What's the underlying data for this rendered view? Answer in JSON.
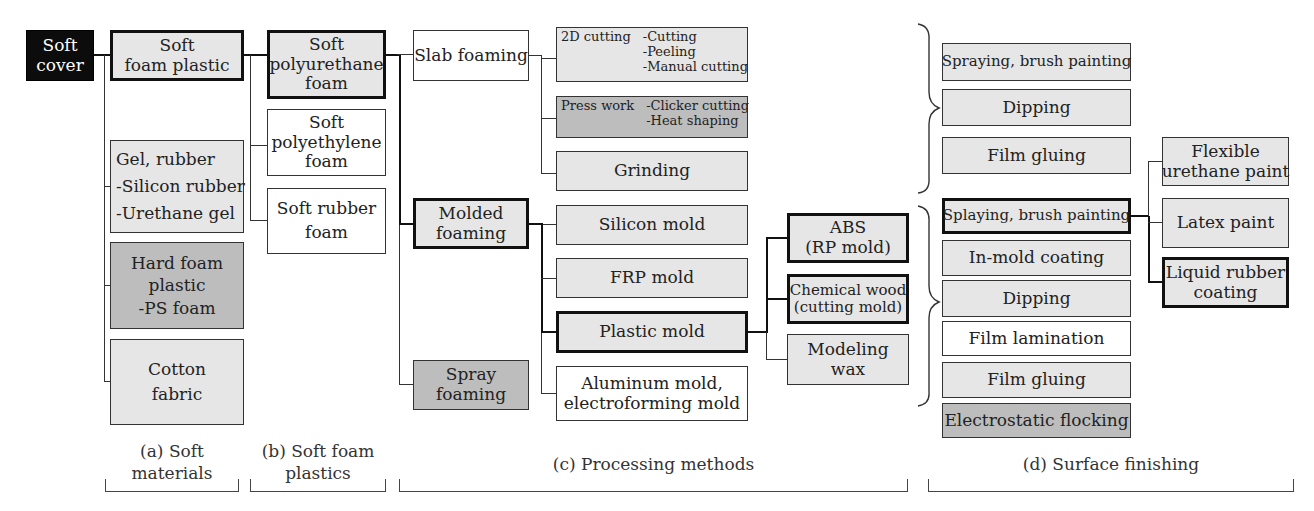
{
  "diagram": {
    "root": {
      "label_lines": [
        "Soft",
        "cover"
      ]
    },
    "soft_materials": [
      {
        "label_lines": [
          "Soft",
          "foam plastic"
        ]
      },
      {
        "label_lines": [
          "Gel, rubber",
          "-Silicon rubber",
          "-Urethane gel"
        ]
      },
      {
        "label_lines": [
          "Hard foam",
          "plastic",
          "-PS foam"
        ]
      },
      {
        "label_lines": [
          "Cotton",
          "fabric"
        ]
      }
    ],
    "soft_foam_plastics": [
      {
        "label_lines": [
          "Soft",
          "polyurethane",
          "foam"
        ]
      },
      {
        "label_lines": [
          "Soft",
          "polyethylene",
          "foam"
        ]
      },
      {
        "label_lines": [
          "Soft rubber",
          "foam"
        ]
      }
    ],
    "foaming_methods": [
      {
        "label_lines": [
          "Slab foaming"
        ]
      },
      {
        "label_lines": [
          "Molded",
          "foaming"
        ]
      },
      {
        "label_lines": [
          "Spray",
          "foaming"
        ]
      }
    ],
    "slab_processes": [
      {
        "title": "2D cutting",
        "items": [
          "-Cutting",
          "-Peeling",
          "-Manual cutting"
        ]
      },
      {
        "title": "Press work",
        "items": [
          "-Clicker cutting",
          "-Heat shaping"
        ]
      },
      {
        "label_lines": [
          "Grinding"
        ]
      }
    ],
    "molds": [
      {
        "label_lines": [
          "Silicon mold"
        ]
      },
      {
        "label_lines": [
          "FRP mold"
        ]
      },
      {
        "label_lines": [
          "Plastic mold"
        ]
      },
      {
        "label_lines": [
          "Aluminum mold,",
          "electroforming mold"
        ]
      }
    ],
    "plastic_mold_types": [
      {
        "label_lines": [
          "ABS",
          "(RP mold)"
        ]
      },
      {
        "label_lines": [
          "Chemical wood",
          "(cutting mold)"
        ]
      },
      {
        "label_lines": [
          "Modeling",
          "wax"
        ]
      }
    ],
    "finishing_group_1": [
      {
        "label_lines": [
          "Spraying, brush painting"
        ]
      },
      {
        "label_lines": [
          "Dipping"
        ]
      },
      {
        "label_lines": [
          "Film gluing"
        ]
      }
    ],
    "finishing_group_2": [
      {
        "label_lines": [
          "Splaying, brush painting"
        ]
      },
      {
        "label_lines": [
          "In-mold coating"
        ]
      },
      {
        "label_lines": [
          "Dipping"
        ]
      },
      {
        "label_lines": [
          "Film lamination"
        ]
      },
      {
        "label_lines": [
          "Film gluing"
        ]
      },
      {
        "label_lines": [
          "Electrostatic flocking"
        ]
      }
    ],
    "paints": [
      {
        "label_lines": [
          "Flexible",
          "urethane paint"
        ]
      },
      {
        "label_lines": [
          "Latex paint"
        ]
      },
      {
        "label_lines": [
          "Liquid rubber",
          "coating"
        ]
      }
    ]
  },
  "sections": [
    {
      "label_lines": [
        "(a) Soft",
        "materials"
      ]
    },
    {
      "label_lines": [
        "(b) Soft foam",
        "plastics"
      ]
    },
    {
      "label_lines": [
        "(c) Processing methods"
      ]
    },
    {
      "label_lines": [
        "(d) Surface finishing"
      ]
    }
  ],
  "colors": {
    "light_fill": "#e6e6e6",
    "dark_fill": "#bdbdbd",
    "white_fill": "#ffffff",
    "root_fill": "#0c0c0c",
    "line": "#333333"
  }
}
